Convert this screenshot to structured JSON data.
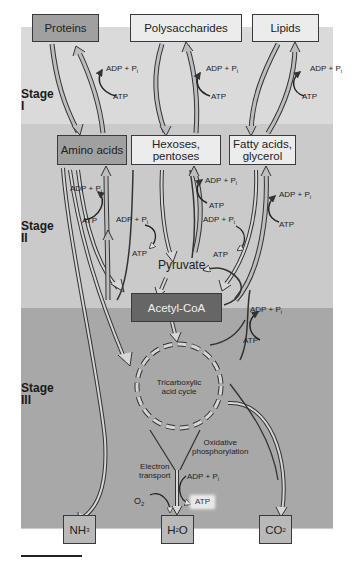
{
  "stages": [
    {
      "id": "I",
      "label": "Stage",
      "numeral": "I",
      "bg": "#dadada"
    },
    {
      "id": "II",
      "label": "Stage",
      "numeral": "II",
      "bg": "#cacaca"
    },
    {
      "id": "III",
      "label": "Stage",
      "numeral": "III",
      "bg": "#a8a8a8"
    }
  ],
  "nodes": {
    "proteins": "Proteins",
    "polysaccharides": "Polysaccharides",
    "lipids": "Lipids",
    "amino_acids": "Amino acids",
    "hexoses": "Hexoses, pentoses",
    "fatty_acids_line1": "Fatty acids,",
    "fatty_acids_line2": "glycerol",
    "pyruvate": "Pyruvate",
    "acetyl_coa": "Acetyl-CoA",
    "tca_line1": "Tricarboxylic",
    "tca_line2": "acid cycle",
    "nh3_main": "NH",
    "nh3_sub": "3",
    "h2o_pre": "H",
    "h2o_sub": "2",
    "h2o_post": "O",
    "co2_main": "CO",
    "co2_sub": "2"
  },
  "labels": {
    "adp_pi": "ADP + P",
    "pi_sub": "i",
    "atp": "ATP",
    "oxidative_line1": "Oxidative",
    "oxidative_line2": "phosphorylation",
    "electron_line1": "Electron",
    "electron_line2": "transport",
    "o2_main": "O",
    "o2_sub": "2"
  },
  "colors": {
    "stage1_bg": "#dadada",
    "stage2_bg": "#cacaca",
    "stage3_bg": "#a8a8a8",
    "light_box": "#ececec",
    "medium_box": "#a0a0a0",
    "dark_box": "#666666",
    "arrow_fill": "#bdbdbd",
    "arrow_stroke": "#333333"
  }
}
